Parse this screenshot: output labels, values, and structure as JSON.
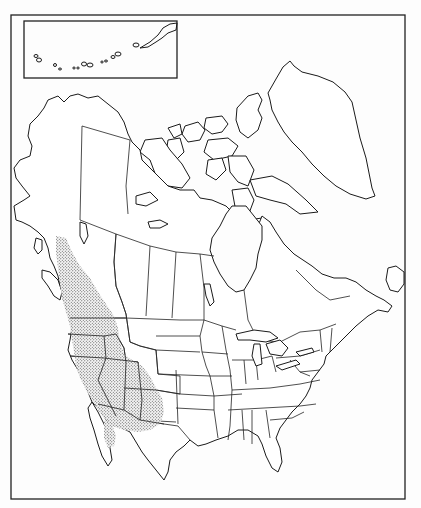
{
  "map": {
    "type": "species range map",
    "region": "North America",
    "style": "black-and-white outline map with stippled range",
    "inset": {
      "label": "Aleutian Islands inset"
    },
    "legend": {
      "range_fill": "stippled dots"
    },
    "range_description": "Western North America: coastal British Columbia through Washington, Oregon, Idaho, Nevada, Utah, eastern California, Arizona and New Mexico; southern extension into northern Baja California",
    "colors": {
      "ink": "#1a1a1a",
      "paper": "#ffffff",
      "stipple": "#333333"
    }
  }
}
